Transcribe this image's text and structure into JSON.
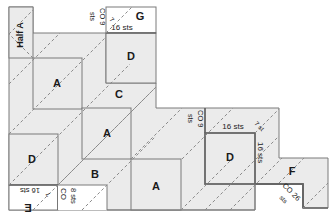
{
  "diagram": {
    "type": "knitting-schematic",
    "colors": {
      "fill": "#ebebeb",
      "outline": "#777777",
      "dashed": "#8a8a8a",
      "bold_outline": "#666666",
      "text": "#1a1a1a"
    },
    "blocks": [
      {
        "id": "half-a",
        "label": "Half A"
      },
      {
        "id": "a1",
        "label": "A"
      },
      {
        "id": "a2",
        "label": "A"
      },
      {
        "id": "a3",
        "label": "A"
      },
      {
        "id": "b",
        "label": "B"
      },
      {
        "id": "c",
        "label": "C"
      },
      {
        "id": "d-top",
        "label": "D"
      },
      {
        "id": "d-left",
        "label": "D"
      },
      {
        "id": "d-right",
        "label": "D"
      },
      {
        "id": "e",
        "label": "E"
      },
      {
        "id": "f",
        "label": "F"
      },
      {
        "id": "g",
        "label": "G"
      }
    ],
    "annotations": {
      "g_co": "CO 9",
      "g_sts": "sts",
      "g_seven": "7",
      "g_sts_small": "sts",
      "g_width": "16 sts",
      "e_width": "16 sts",
      "e_seven": "7",
      "e_sts_small": "sts",
      "e_co": "CO",
      "e_eight": "8 sts",
      "d_co": "CO 9",
      "d_sts": "sts",
      "d_width": "16 sts",
      "d_seven": "7 st",
      "d_height": "16 sts",
      "f_co": "CO 26",
      "f_sts": "sts"
    }
  }
}
